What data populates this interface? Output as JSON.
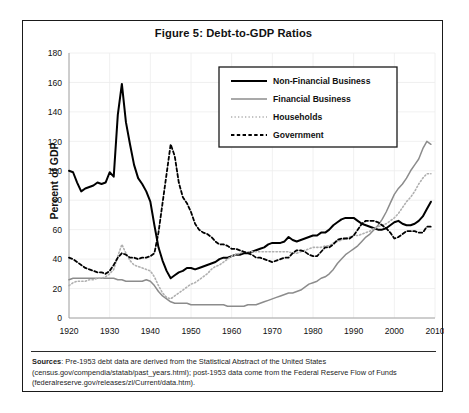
{
  "figure": {
    "title": "Figure 5: Debt-to-GDP Ratios",
    "source_label": "Sources",
    "source_text": ": Pre-1953 debt data are derived from the Statistical Abstract of the United States (census.gov/compendia/statab/past_years.html); post-1953 data come from the Federal Reserve Flow of Funds (federalreserve.gov/releases/zl/Current/data.htm)."
  },
  "colors": {
    "non_financial_business": "#000000",
    "financial_business": "#8c8c8c",
    "households": "#b0b0b0",
    "government": "#000000",
    "frame": "#1a1a1a",
    "gridline": "#ececec"
  },
  "chart_data": {
    "type": "line",
    "title": "Figure 5: Debt-to-GDP Ratios",
    "xlabel": "",
    "ylabel": "Percent of GDP",
    "xlim": [
      1920,
      2010
    ],
    "ylim": [
      0,
      180
    ],
    "ytick_step": 20,
    "xtick_step": 10,
    "grid": true,
    "legend_position": "top-right",
    "ytick_labels": [
      "0",
      "20",
      "40",
      "60",
      "80",
      "100",
      "120",
      "140",
      "160",
      "180"
    ],
    "xtick_labels": [
      "1920",
      "1930",
      "1940",
      "1950",
      "1960",
      "1970",
      "1980",
      "1990",
      "2000",
      "2010"
    ],
    "x": [
      1920,
      1921,
      1922,
      1923,
      1924,
      1925,
      1926,
      1927,
      1928,
      1929,
      1930,
      1931,
      1932,
      1933,
      1934,
      1935,
      1936,
      1937,
      1938,
      1939,
      1940,
      1941,
      1942,
      1943,
      1944,
      1945,
      1946,
      1947,
      1948,
      1949,
      1950,
      1951,
      1952,
      1953,
      1954,
      1955,
      1956,
      1957,
      1958,
      1959,
      1960,
      1961,
      1962,
      1963,
      1964,
      1965,
      1966,
      1967,
      1968,
      1969,
      1970,
      1971,
      1972,
      1973,
      1974,
      1975,
      1976,
      1977,
      1978,
      1979,
      1980,
      1981,
      1982,
      1983,
      1984,
      1985,
      1986,
      1987,
      1988,
      1989,
      1990,
      1991,
      1992,
      1993,
      1994,
      1995,
      1996,
      1997,
      1998,
      1999,
      2000,
      2001,
      2002,
      2003,
      2004,
      2005,
      2006,
      2007,
      2008,
      2009
    ],
    "series": [
      {
        "name": "Non-Financial Business",
        "style": "solid-thick-black",
        "values": [
          100,
          99,
          92,
          86,
          88,
          89,
          90,
          92,
          91,
          92,
          99,
          96,
          138,
          159,
          133,
          118,
          104,
          95,
          91,
          86,
          79,
          63,
          48,
          39,
          32,
          27,
          29,
          31,
          32,
          34,
          34,
          33,
          34,
          35,
          36,
          37,
          38,
          40,
          41,
          41,
          42,
          43,
          43,
          44,
          44,
          45,
          46,
          47,
          48,
          50,
          51,
          51,
          51,
          52,
          55,
          53,
          52,
          53,
          54,
          55,
          56,
          56,
          58,
          58,
          60,
          63,
          65,
          67,
          68,
          68,
          68,
          66,
          64,
          63,
          62,
          61,
          60,
          60,
          61,
          63,
          65,
          66,
          64,
          63,
          63,
          64,
          66,
          69,
          74,
          79
        ]
      },
      {
        "name": "Financial Business",
        "style": "solid-gray",
        "values": [
          26,
          27,
          27,
          27,
          27,
          27,
          27,
          27,
          27,
          27,
          27,
          27,
          26,
          26,
          25,
          25,
          25,
          25,
          25,
          26,
          25,
          22,
          18,
          15,
          13,
          11,
          10,
          10,
          10,
          10,
          9,
          9,
          9,
          9,
          9,
          9,
          9,
          9,
          9,
          8,
          8,
          8,
          8,
          8,
          9,
          9,
          9,
          10,
          11,
          12,
          13,
          14,
          15,
          16,
          17,
          17,
          18,
          19,
          21,
          23,
          24,
          25,
          27,
          28,
          30,
          33,
          37,
          40,
          43,
          45,
          47,
          49,
          52,
          55,
          57,
          60,
          63,
          67,
          72,
          78,
          84,
          88,
          91,
          95,
          100,
          104,
          108,
          115,
          120,
          118
        ]
      },
      {
        "name": "Households",
        "style": "dotted-light",
        "values": [
          22,
          24,
          25,
          25,
          25,
          26,
          26,
          27,
          27,
          28,
          30,
          33,
          42,
          50,
          44,
          39,
          36,
          35,
          34,
          33,
          32,
          28,
          22,
          17,
          14,
          13,
          15,
          17,
          19,
          21,
          23,
          24,
          26,
          28,
          30,
          33,
          35,
          36,
          38,
          40,
          42,
          43,
          44,
          45,
          45,
          45,
          45,
          45,
          45,
          45,
          45,
          45,
          45,
          45,
          45,
          44,
          44,
          45,
          46,
          47,
          48,
          48,
          48,
          49,
          49,
          51,
          52,
          53,
          54,
          55,
          56,
          56,
          57,
          58,
          59,
          61,
          62,
          63,
          64,
          66,
          68,
          71,
          75,
          79,
          82,
          86,
          91,
          95,
          98,
          98
        ]
      },
      {
        "name": "Government",
        "style": "dashed-bold-black",
        "values": [
          41,
          40,
          38,
          36,
          34,
          33,
          32,
          31,
          31,
          30,
          32,
          36,
          41,
          44,
          43,
          41,
          41,
          40,
          41,
          41,
          42,
          44,
          58,
          78,
          98,
          118,
          110,
          92,
          82,
          78,
          72,
          64,
          60,
          58,
          57,
          55,
          52,
          50,
          50,
          49,
          47,
          47,
          46,
          45,
          44,
          43,
          41,
          41,
          40,
          39,
          38,
          39,
          40,
          41,
          41,
          44,
          46,
          46,
          45,
          43,
          42,
          42,
          45,
          48,
          48,
          50,
          53,
          54,
          54,
          54,
          56,
          60,
          64,
          66,
          66,
          66,
          65,
          63,
          61,
          58,
          54,
          55,
          57,
          59,
          59,
          59,
          58,
          58,
          62,
          62
        ]
      }
    ]
  },
  "legend": {
    "items": [
      {
        "label": "Non-Financial Business",
        "style": "solid-thick-black"
      },
      {
        "label": "Financial Business",
        "style": "solid-gray"
      },
      {
        "label": "Households",
        "style": "dotted-light"
      },
      {
        "label": "Government",
        "style": "dashed-bold-black"
      }
    ]
  }
}
